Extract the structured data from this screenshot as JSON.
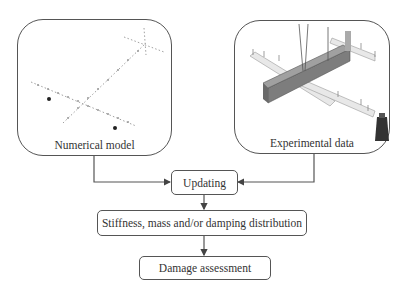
{
  "nodes": {
    "numerical_model": {
      "label": "Numerical model"
    },
    "experimental_data": {
      "label": "Experimental data"
    },
    "updating": {
      "label": "Updating"
    },
    "distribution": {
      "label": "Stiffness, mass and/or damping distribution"
    },
    "damage": {
      "label": "Damage assessment"
    }
  },
  "edges": [
    {
      "from": "numerical_model",
      "to": "updating"
    },
    {
      "from": "experimental_data",
      "to": "updating"
    },
    {
      "from": "updating",
      "to": "distribution"
    },
    {
      "from": "distribution",
      "to": "damage"
    }
  ],
  "colors": {
    "stroke": "#555555",
    "text": "#333333",
    "beam": "#8a8a8a",
    "plate": "#e6e6e6"
  }
}
